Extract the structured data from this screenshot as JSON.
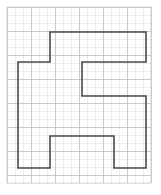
{
  "figure": {
    "background_color": "#ffffff"
  },
  "grid": {
    "name": "square-grid",
    "origin_x": 7,
    "origin_y": 7,
    "cell_size": 8,
    "columns": 18,
    "rows": 22,
    "width": 144,
    "height": 176,
    "minor_line_color": "#dedede",
    "major_line_color": "#b6b6b6",
    "major_every": 3,
    "border_color": "#c9c9c9",
    "minor_line_width": 0.5,
    "major_line_width": 0.7
  },
  "shape": {
    "name": "polygon-outline",
    "stroke_color": "#4a4a4a",
    "stroke_width": 1.6,
    "fill": "none",
    "closed": true,
    "vertices_px": [
      [
        50,
        32
      ],
      [
        146,
        32
      ],
      [
        146,
        62
      ],
      [
        82,
        62
      ],
      [
        82,
        96
      ],
      [
        146,
        96
      ],
      [
        146,
        168
      ],
      [
        114,
        168
      ],
      [
        114,
        136
      ],
      [
        50,
        136
      ],
      [
        50,
        168
      ],
      [
        18,
        168
      ],
      [
        18,
        62
      ],
      [
        50,
        62
      ]
    ],
    "vertices_cells": [
      [
        5.375,
        3.125
      ],
      [
        17.375,
        3.125
      ],
      [
        17.375,
        6.875
      ],
      [
        9.375,
        6.875
      ],
      [
        9.375,
        11.125
      ],
      [
        17.375,
        11.125
      ],
      [
        17.375,
        20.125
      ],
      [
        13.375,
        20.125
      ],
      [
        13.375,
        16.125
      ],
      [
        5.375,
        16.125
      ],
      [
        5.375,
        20.125
      ],
      [
        1.375,
        20.125
      ],
      [
        1.375,
        6.875
      ],
      [
        5.375,
        6.875
      ]
    ]
  },
  "corner_mark": {
    "name": "corner-tick",
    "label": "",
    "x": 3,
    "y": 1
  }
}
